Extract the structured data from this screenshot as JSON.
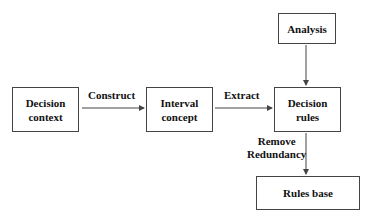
{
  "diagram": {
    "nodes": {
      "decision_context": "Decision\ncontext",
      "interval_concept": "Interval\nconcept",
      "decision_rules": "Decision\nrules",
      "analysis": "Analysis",
      "rules_base": "Rules base"
    },
    "edges": {
      "construct": "Construct",
      "extract": "Extract",
      "remove_redundancy_line1": "Remove",
      "remove_redundancy_line2": "Redundancy"
    },
    "connections": [
      {
        "from": "Decision context",
        "to": "Interval concept",
        "label": "Construct"
      },
      {
        "from": "Interval concept",
        "to": "Decision rules",
        "label": "Extract"
      },
      {
        "from": "Analysis",
        "to": "Decision rules",
        "label": ""
      },
      {
        "from": "Decision rules",
        "to": "Rules base",
        "label": "Remove Redundancy"
      }
    ],
    "colors": {
      "line": "#444444",
      "text": "#111111",
      "background": "#ffffff"
    }
  }
}
